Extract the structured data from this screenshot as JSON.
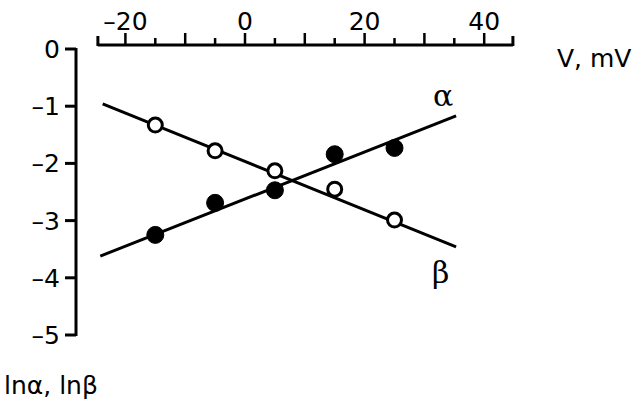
{
  "chart_data": {
    "type": "scatter",
    "title": "",
    "xlabel": "V, mV",
    "ylabel": "lnα, lnβ",
    "xlim": [
      -24.6,
      44.8
    ],
    "ylim": [
      -5,
      0
    ],
    "x_ticks_major": [
      -20,
      0,
      20,
      40
    ],
    "x_tick_labels": [
      "-20",
      "0",
      "20",
      "40"
    ],
    "x_ticks_minor_step": 5,
    "y_ticks": [
      0,
      -1,
      -2,
      -3,
      -4,
      -5
    ],
    "y_tick_labels": [
      "0",
      "-1",
      "-2",
      "-3",
      "-4",
      "-5"
    ],
    "x_axis_position": "top",
    "grid": false,
    "legend": "none; curves labeled inline",
    "series": [
      {
        "name": "α",
        "label": "α",
        "marker": "filled circle",
        "x": [
          -15,
          -5,
          5,
          15,
          25
        ],
        "values": [
          -3.25,
          -2.69,
          -2.47,
          -1.84,
          -1.73
        ],
        "fit_line": {
          "x": [
            -24.2,
            35.3
          ],
          "y": [
            -3.62,
            -1.17
          ]
        }
      },
      {
        "name": "β",
        "label": "β",
        "marker": "open circle",
        "x": [
          -15,
          -5,
          5,
          15,
          25
        ],
        "values": [
          -1.33,
          -1.78,
          -2.13,
          -2.45,
          -2.99
        ],
        "fit_line": {
          "x": [
            -23.8,
            35.3
          ],
          "y": [
            -0.96,
            -3.46
          ]
        }
      }
    ],
    "annotations": [
      {
        "text": "α",
        "near": "end of rising line"
      },
      {
        "text": "β",
        "near": "end of falling line"
      }
    ]
  },
  "labels": {
    "x_axis_title": "V, mV",
    "y_axis_title": "lnα, lnβ",
    "alpha": "α",
    "beta": "β"
  }
}
